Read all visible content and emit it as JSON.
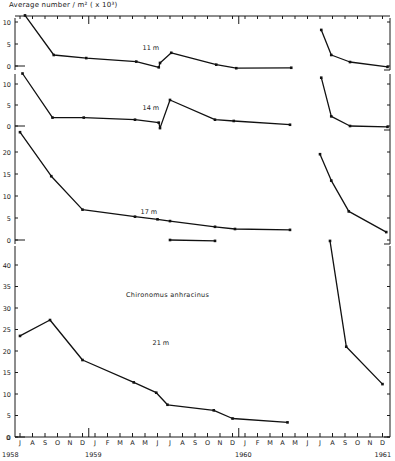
{
  "chart_data": {
    "type": "line",
    "title": "",
    "ylabel": "Average number / m² ( x 10³)",
    "xlabel": "",
    "species_label": "Chironomus anhracinus",
    "x_months": [
      "J",
      "A",
      "S",
      "O",
      "N",
      "D",
      "J",
      "F",
      "M",
      "A",
      "M",
      "J",
      "J",
      "A",
      "S",
      "O",
      "N",
      "D",
      "J",
      "F",
      "M",
      "A",
      "M",
      "J",
      "J",
      "A",
      "S",
      "O",
      "N",
      "D"
    ],
    "x_years": [
      {
        "label": "1958",
        "month_index": 0
      },
      {
        "label": "1959",
        "month_index": 6
      },
      {
        "label": "1960",
        "month_index": 18
      },
      {
        "label": "1961",
        "month_index": 29
      }
    ],
    "x_month_start": "Jul 1958",
    "panels": [
      {
        "name": "11 m",
        "label": "11 m",
        "ylim": [
          0,
          11
        ],
        "yticks": [
          0,
          5,
          10
        ],
        "segments": [
          [
            [
              0.4,
              11.5
            ],
            [
              2.7,
              2.5
            ],
            [
              5.3,
              1.8
            ],
            [
              9.3,
              1.0
            ],
            [
              11.1,
              -0.3
            ],
            [
              11.2,
              0.7
            ],
            [
              12.1,
              3.0
            ],
            [
              15.7,
              0.3
            ],
            [
              17.3,
              -0.5
            ],
            [
              21.7,
              -0.4
            ]
          ],
          [
            [
              24.1,
              8.2
            ],
            [
              24.9,
              2.5
            ],
            [
              26.4,
              0.9
            ],
            [
              29.4,
              -0.2
            ]
          ]
        ]
      },
      {
        "name": "14 m",
        "label": "14 m",
        "ylim": [
          0,
          12
        ],
        "yticks": [
          0,
          5,
          10
        ],
        "segments": [
          [
            [
              0.2,
              12.5
            ],
            [
              2.6,
              2.0
            ],
            [
              5.1,
              2.0
            ],
            [
              9.2,
              1.5
            ],
            [
              11.1,
              0.8
            ],
            [
              11.2,
              -0.5
            ],
            [
              12.0,
              6.2
            ],
            [
              15.6,
              1.5
            ],
            [
              17.1,
              1.2
            ],
            [
              21.6,
              0.3
            ]
          ],
          [
            [
              24.1,
              11.5
            ],
            [
              24.9,
              2.3
            ],
            [
              26.4,
              0.0
            ],
            [
              29.4,
              -0.2
            ]
          ]
        ]
      },
      {
        "name": "17 m",
        "label": "17 m",
        "ylim": [
          0,
          24
        ],
        "yticks": [
          0,
          5,
          10,
          15,
          20
        ],
        "segments": [
          [
            [
              0.0,
              24.5
            ],
            [
              2.5,
              14.5
            ],
            [
              5.0,
              6.9
            ],
            [
              9.2,
              5.3
            ],
            [
              11.0,
              4.7
            ],
            [
              12.0,
              4.3
            ],
            [
              15.6,
              3.0
            ],
            [
              17.2,
              2.5
            ],
            [
              21.6,
              2.3
            ]
          ],
          [
            [
              12.0,
              0.0
            ],
            [
              15.6,
              -0.2
            ]
          ],
          [
            [
              24.0,
              19.5
            ],
            [
              24.9,
              13.5
            ],
            [
              26.3,
              6.5
            ],
            [
              29.3,
              1.8
            ]
          ]
        ]
      },
      {
        "name": "21 m",
        "label": "21 m",
        "ylim": [
          0,
          44
        ],
        "yticks": [
          0,
          5,
          10,
          15,
          20,
          25,
          30,
          35,
          40
        ],
        "segments": [
          [
            [
              0.0,
              23.5
            ],
            [
              2.4,
              27.2
            ],
            [
              5.0,
              17.9
            ],
            [
              9.1,
              12.7
            ],
            [
              10.9,
              10.3
            ],
            [
              11.8,
              7.5
            ],
            [
              15.5,
              6.2
            ],
            [
              17.0,
              4.3
            ],
            [
              21.4,
              3.4
            ]
          ],
          [
            [
              24.8,
              45.6
            ],
            [
              26.1,
              21.0
            ],
            [
              29.0,
              12.3
            ]
          ]
        ]
      }
    ]
  },
  "layout": {
    "x0_px": 20,
    "month_px": 12.5,
    "axis_left_px": 15,
    "axis_right_px": 390,
    "panels_px": [
      {
        "y0": 66,
        "px_per_unit": 4.4,
        "top": 18,
        "bottom": 70
      },
      {
        "y0": 126,
        "px_per_unit": 4.2,
        "top": 74,
        "bottom": 130
      },
      {
        "y0": 240,
        "px_per_unit": 4.4,
        "top": 130,
        "bottom": 244
      },
      {
        "y0": 437,
        "px_per_unit": 4.3,
        "top": 246,
        "bottom": 437
      }
    ]
  }
}
